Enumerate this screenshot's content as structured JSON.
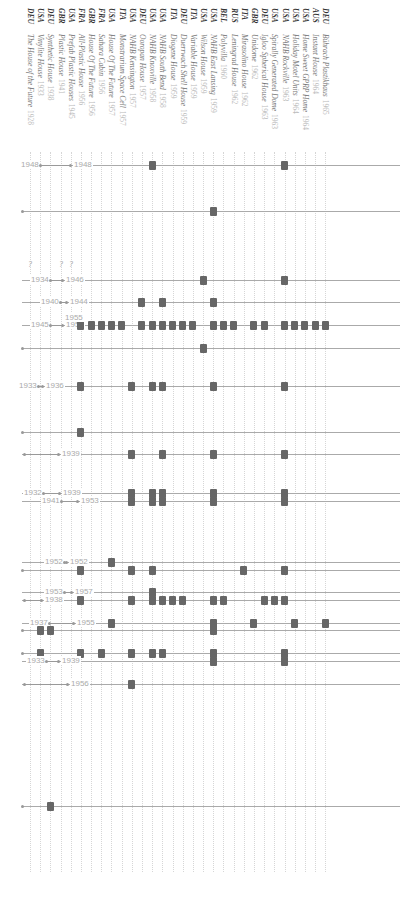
{
  "chart_data": {
    "type": "table",
    "orientation": "columns rotated 90deg, rows are timeline tracks",
    "columns": [
      {
        "country": "DEU",
        "name": "The House of the Future",
        "year": "1928"
      },
      {
        "country": "USA",
        "name": "Vinylite House",
        "year": "1933"
      },
      {
        "country": "DEU",
        "name": "Synthetic House",
        "year": "1938"
      },
      {
        "country": "GBR",
        "name": "Plastic House",
        "year": "1941"
      },
      {
        "country": "USA",
        "name": "Prefab Plastic Houses",
        "year": "1945"
      },
      {
        "country": "FRA",
        "name": "All-Plastic House",
        "year": "1956"
      },
      {
        "country": "GBR",
        "name": "House Of The Future",
        "year": "1956"
      },
      {
        "country": "FRA",
        "name": "Sahara Cabin",
        "year": "1956"
      },
      {
        "country": "USA",
        "name": "House Of The Future",
        "year": "1957"
      },
      {
        "country": "ITA",
        "name": "Monstrarium Space Cell",
        "year": "1957"
      },
      {
        "country": "USA",
        "name": "NAHB Kensington",
        "year": "1957"
      },
      {
        "country": "DEU",
        "name": "Ooropan House",
        "year": "1957"
      },
      {
        "country": "USA",
        "name": "NAHB Knoxville",
        "year": "1958"
      },
      {
        "country": "USA",
        "name": "NAHB South Bend",
        "year": "1958"
      },
      {
        "country": "ITA",
        "name": "Diogene House",
        "year": "1959"
      },
      {
        "country": "DEU",
        "name": "Duerrwach Shell House",
        "year": "1959"
      },
      {
        "country": "ITA",
        "name": "Variable House",
        "year": "1959"
      },
      {
        "country": "USA",
        "name": "Wilson House",
        "year": "1959"
      },
      {
        "country": "USA",
        "name": "NAHB East Lansing",
        "year": "1959"
      },
      {
        "country": "BEL",
        "name": "Polyvilla",
        "year": "1960"
      },
      {
        "country": "RUS",
        "name": "Leningrad House",
        "year": "1962"
      },
      {
        "country": "ITA",
        "name": "Mirasolino House",
        "year": "1962"
      },
      {
        "country": "GBR",
        "name": "Unidome",
        "year": "1962"
      },
      {
        "country": "DEU",
        "name": "Igloo Spherical House",
        "year": "1963"
      },
      {
        "country": "USA",
        "name": "Spirally Generated Dome",
        "year": "1963"
      },
      {
        "country": "USA",
        "name": "NAHB Rockville",
        "year": "1963"
      },
      {
        "country": "USA",
        "name": "Holiday Motel Units",
        "year": "1964"
      },
      {
        "country": "USA",
        "name": "Home Sweet GPRP Home",
        "year": "1964"
      },
      {
        "country": "AUS",
        "name": "Instant House",
        "year": "1964"
      },
      {
        "country": "DEU",
        "name": "Bührach Plastikhaus",
        "year": "1965"
      }
    ],
    "rows": [
      {
        "y": 165,
        "range": {
          "from": "1948",
          "to": "1948",
          "x1": 40,
          "x2": 70
        },
        "markers": [
          12,
          25
        ]
      },
      {
        "y": 211,
        "range": null,
        "markers": [
          18
        ]
      },
      {
        "y": 280,
        "range": {
          "from": "1934",
          "to": "1946",
          "x1": 50,
          "x2": 62
        },
        "markers": [
          17,
          25
        ]
      },
      {
        "y": 302,
        "range": {
          "from": "1940",
          "to": "1944",
          "x1": 60,
          "x2": 66
        },
        "markers": [
          11,
          13,
          18
        ]
      },
      {
        "y": 325,
        "range": {
          "from": "1945",
          "to": "1955",
          "x1": 50,
          "x2": 62
        },
        "markers": [
          5,
          6,
          7,
          8,
          9,
          11,
          12,
          13,
          14,
          15,
          16,
          18,
          19,
          20,
          22,
          23,
          25,
          26,
          27,
          28,
          29
        ]
      },
      {
        "y": 348,
        "range": null,
        "markers": [
          17
        ]
      },
      {
        "y": 386,
        "range": {
          "from": "1933",
          "to": "1936",
          "x1": 38,
          "x2": 42
        },
        "markers": [
          5,
          10,
          12,
          13,
          18,
          25
        ]
      },
      {
        "y": 432,
        "range": null,
        "markers": [
          5
        ]
      },
      {
        "y": 454,
        "range": {
          "from": "1939",
          "x1": 24,
          "x2": 58
        },
        "markers": [
          10,
          13,
          18,
          25
        ]
      },
      {
        "y": 493,
        "range": {
          "from": "1932",
          "to": "1939",
          "x1": 43,
          "x2": 59
        },
        "markers": [
          10,
          12,
          13,
          18,
          25
        ]
      },
      {
        "y": 501,
        "range": {
          "from": "1941",
          "to": "1953",
          "x1": 61,
          "x2": 77
        },
        "markers": [
          10,
          12,
          13,
          18,
          25
        ]
      },
      {
        "y": 562,
        "range": {
          "from": "1952",
          "to": "1952",
          "x1": 64,
          "x2": 66
        },
        "markers": [
          8
        ]
      },
      {
        "y": 570,
        "range": null,
        "markers": [
          5,
          10,
          12,
          21,
          25
        ]
      },
      {
        "y": 592,
        "range": {
          "from": "1953",
          "to": "1957",
          "x1": 64,
          "x2": 71
        },
        "markers": [
          12
        ]
      },
      {
        "y": 600,
        "range": {
          "from": "1938",
          "x1": 24,
          "x2": 41
        },
        "markers": [
          5,
          10,
          12,
          13,
          14,
          15,
          18,
          19,
          23,
          24,
          25
        ]
      },
      {
        "y": 623,
        "range": {
          "from": "1937",
          "to": "1955",
          "x1": 49,
          "x2": 73
        },
        "markers": [
          8,
          18,
          22,
          26,
          29
        ]
      },
      {
        "y": 630,
        "range": null,
        "markers": [
          1,
          2,
          18
        ]
      },
      {
        "y": 653,
        "range": null,
        "markers": [
          1,
          5,
          7,
          10,
          12,
          13,
          18,
          25
        ]
      },
      {
        "y": 661,
        "range": {
          "from": "1933",
          "to": "1939",
          "x1": 46,
          "x2": 58
        },
        "markers": [
          18,
          25
        ]
      },
      {
        "y": 684,
        "range": {
          "from": "1956",
          "x1": 24,
          "x2": 67
        },
        "markers": [
          10
        ]
      },
      {
        "y": 806,
        "range": null,
        "markers": [
          2
        ]
      }
    ],
    "unknown_marks": [
      {
        "x": 30,
        "y": 265,
        "text": "?"
      },
      {
        "x": 61,
        "y": 265,
        "text": "?"
      },
      {
        "x": 71,
        "y": 265,
        "text": "?"
      }
    ],
    "xlabel": "",
    "ylabel": ""
  }
}
